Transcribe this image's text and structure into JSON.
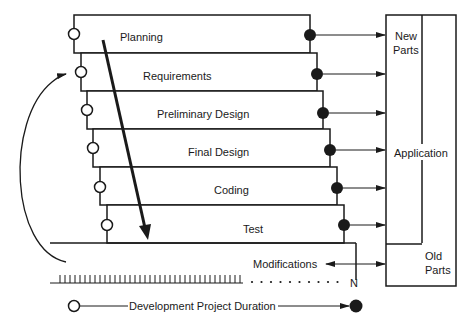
{
  "diagram": {
    "phases": [
      {
        "label": "Planning"
      },
      {
        "label": "Requirements"
      },
      {
        "label": "Preliminary Design"
      },
      {
        "label": "Final Design"
      },
      {
        "label": "Coding"
      },
      {
        "label": "Test"
      }
    ],
    "application_box": {
      "label": "Application",
      "new_parts_line1": "New",
      "new_parts_line2": "Parts",
      "old_parts_line1": "Old",
      "old_parts_line2": "Parts"
    },
    "modifications_label": "Modifications",
    "timeline_end_label": "N",
    "legend": {
      "label": "Development Project Duration"
    },
    "colors": {
      "line": "#1a1a1a",
      "background": "#ffffff"
    }
  }
}
